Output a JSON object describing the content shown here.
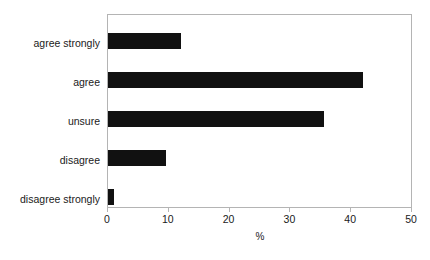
{
  "chart_data": {
    "type": "bar",
    "orientation": "horizontal",
    "title": "",
    "xlabel": "%",
    "ylabel": "",
    "categories": [
      "agree strongly",
      "agree",
      "unsure",
      "disagree",
      "disagree strongly"
    ],
    "values": [
      12,
      42,
      35.5,
      9.5,
      1
    ],
    "xlim": [
      0,
      50
    ],
    "xticks": [
      0,
      10,
      20,
      30,
      40,
      50
    ],
    "xtick_labels": [
      "0",
      "10",
      "20",
      "30",
      "40",
      "50"
    ],
    "grid": false,
    "legend": false,
    "bar_color": "#111111",
    "frame_color": "#b4b4b4",
    "background_color": "#ffffff"
  }
}
